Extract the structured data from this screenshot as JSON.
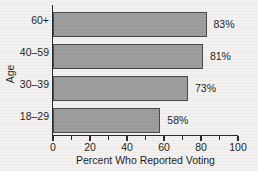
{
  "chart_data": {
    "type": "bar",
    "orientation": "horizontal",
    "title": "",
    "xlabel": "Percent Who Reported Voting",
    "ylabel": "Age",
    "categories": [
      "18–29",
      "30–39",
      "40–59",
      "60+"
    ],
    "values": [
      58,
      73,
      81,
      83
    ],
    "value_labels": [
      "58%",
      "73%",
      "81%",
      "83%"
    ],
    "xlim": [
      0,
      100
    ],
    "xticks": [
      0,
      20,
      40,
      60,
      80,
      100
    ],
    "xtick_labels": [
      "0",
      "20",
      "40",
      "60",
      "80",
      "100"
    ],
    "xminor_ticks": [
      10,
      30,
      50,
      70,
      90
    ],
    "grid": false,
    "legend": null,
    "bar_color": "#9d9d9d",
    "bar_edge_color": "#4a4a4a",
    "background_color": "#f2f1ef",
    "axis_color": "#2b2b2b"
  },
  "bars": [
    {
      "category": "60+",
      "value": 83,
      "label": "83%"
    },
    {
      "category": "40–59",
      "value": 81,
      "label": "81%"
    },
    {
      "category": "30–39",
      "value": 73,
      "label": "73%"
    },
    {
      "category": "18–29",
      "value": 58,
      "label": "58%"
    }
  ],
  "axes": {
    "x_title": "Percent Who Reported Voting",
    "y_title": "Age",
    "x_tick_labels": [
      "0",
      "20",
      "40",
      "60",
      "80",
      "100"
    ]
  }
}
